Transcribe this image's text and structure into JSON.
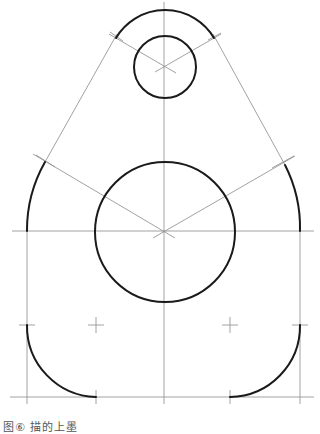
{
  "figure": {
    "caption": "图⑥ 描的上墨",
    "colors": {
      "thick_line": "#1a1a1a",
      "thin_line": "#8a8a8a",
      "background": "#ffffff"
    }
  },
  "geometry": {
    "centerlines": {
      "vertical_x": 164,
      "horizontal_y": 231,
      "bottom_y": 397,
      "left_x": 27,
      "right_x": 300
    },
    "small_circle": {
      "cx": 165,
      "cy": 67,
      "r": 31
    },
    "outer_top_arc": {
      "cx": 165,
      "cy": 67,
      "r": 57
    },
    "big_circle": {
      "cx": 165,
      "cy": 232,
      "r": 70
    },
    "side_arc_radius": 138,
    "fillet_centers": [
      {
        "cx": 96,
        "cy": 325
      },
      {
        "cx": 230,
        "cy": 325
      }
    ],
    "fillet_radius": 71
  }
}
